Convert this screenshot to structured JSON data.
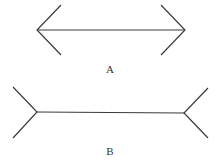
{
  "figures": [
    {
      "label": "A",
      "type": "arrowheads-inward",
      "line": {
        "x1": 37,
        "y1": 30,
        "x2": 185,
        "y2": 30
      }
    },
    {
      "label": "B",
      "type": "fins-outward",
      "line": {
        "x1": 37,
        "y1": 112,
        "x2": 184,
        "y2": 112
      }
    }
  ],
  "colors": {
    "stroke": "#3a3a3a",
    "background": "#ffffff"
  }
}
